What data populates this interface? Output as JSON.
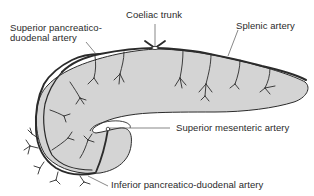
{
  "diagram": {
    "colors": {
      "organ_fill": "#d4d4d4",
      "outline": "#2b2b2b",
      "vessel": "#2b2b2b",
      "background": "#ffffff",
      "text": "#2a2a2a"
    },
    "labels": {
      "coeliac_trunk": "Coeliac trunk",
      "splenic_artery": "Splenic artery",
      "superior_pd_line1": "Superior pancreatico-",
      "superior_pd_line2": "duodenal artery",
      "superior_mesenteric": "Superior mesenteric artery",
      "inferior_pd": "Inferior pancreatico-duodenal artery"
    }
  }
}
